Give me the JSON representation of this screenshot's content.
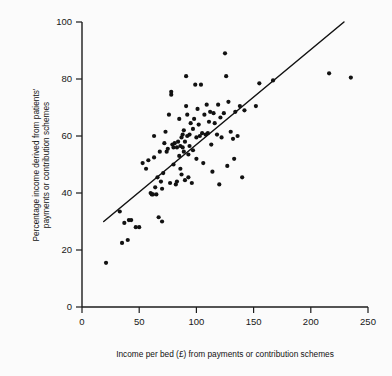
{
  "chart_data": {
    "type": "scatter",
    "title": "",
    "subtitle": "",
    "xlabel": "Income per bed (£) from payments or contribution schemes",
    "ylabel": "Percentage income derived from patients' payments or contribution schemes",
    "ylabel_lines": [
      "Percentage income derived from patients'",
      "payments or contribution schemes"
    ],
    "xlim": [
      0,
      250
    ],
    "ylim": [
      0,
      100
    ],
    "xticks": [
      0,
      50,
      100,
      150,
      200,
      250
    ],
    "yticks": [
      0,
      20,
      40,
      60,
      80,
      100
    ],
    "xtick_labels": [
      "0",
      "50",
      "100",
      "150",
      "200",
      "250"
    ],
    "ytick_labels": [
      "0",
      "20",
      "40",
      "60",
      "80",
      "100"
    ],
    "grid": false,
    "legend": false,
    "legend_position": "none",
    "marker": "filled-circle",
    "marker_color": "#121212",
    "marker_radius_px": 2.1,
    "background_color": "#fbfbfb",
    "axis_color": "#1c1c1c",
    "series": [
      {
        "name": "Hospitals",
        "type": "scatter",
        "points": [
          [
            21,
            15.5
          ],
          [
            33,
            33.5
          ],
          [
            35,
            22.5
          ],
          [
            37,
            29.5
          ],
          [
            40,
            23.5
          ],
          [
            41,
            30.5
          ],
          [
            43,
            30.5
          ],
          [
            47,
            28.0
          ],
          [
            50,
            28.0
          ],
          [
            53,
            50.5
          ],
          [
            56,
            48.5
          ],
          [
            58,
            51.5
          ],
          [
            60,
            40.0
          ],
          [
            61,
            39.5
          ],
          [
            62,
            39.5
          ],
          [
            63,
            60.0
          ],
          [
            63,
            52.5
          ],
          [
            64,
            42.0
          ],
          [
            65,
            39.5
          ],
          [
            66,
            45.5
          ],
          [
            67,
            31.5
          ],
          [
            68,
            54.5
          ],
          [
            69,
            44.0
          ],
          [
            70,
            30.0
          ],
          [
            70,
            41.5
          ],
          [
            71,
            47.0
          ],
          [
            72,
            57.5
          ],
          [
            73,
            61.5
          ],
          [
            74,
            54.5
          ],
          [
            75,
            55.5
          ],
          [
            76,
            67.5
          ],
          [
            77,
            43.5
          ],
          [
            78,
            74.5
          ],
          [
            78,
            75.5
          ],
          [
            79,
            57.0
          ],
          [
            80,
            56.0
          ],
          [
            80,
            50.0
          ],
          [
            81,
            57.5
          ],
          [
            82,
            43.0
          ],
          [
            83,
            56.0
          ],
          [
            83,
            44.0
          ],
          [
            84,
            58.0
          ],
          [
            85,
            53.0
          ],
          [
            85,
            66.0
          ],
          [
            86,
            56.5
          ],
          [
            86,
            48.5
          ],
          [
            87,
            59.5
          ],
          [
            87,
            46.5
          ],
          [
            88,
            60.5
          ],
          [
            88,
            56.0
          ],
          [
            89,
            62.0
          ],
          [
            89,
            54.5
          ],
          [
            90,
            58.0
          ],
          [
            90,
            44.5
          ],
          [
            91,
            81.0
          ],
          [
            91,
            70.5
          ],
          [
            92,
            67.5
          ],
          [
            92,
            60.0
          ],
          [
            93,
            53.5
          ],
          [
            93,
            45.5
          ],
          [
            94,
            60.5
          ],
          [
            94,
            56.5
          ],
          [
            95,
            64.5
          ],
          [
            96,
            43.5
          ],
          [
            97,
            55.0
          ],
          [
            97,
            62.5
          ],
          [
            98,
            66.0
          ],
          [
            99,
            78.0
          ],
          [
            100,
            52.0
          ],
          [
            100,
            59.5
          ],
          [
            101,
            69.5
          ],
          [
            102,
            64.0
          ],
          [
            103,
            60.0
          ],
          [
            104,
            78.0
          ],
          [
            105,
            61.0
          ],
          [
            106,
            50.5
          ],
          [
            107,
            67.5
          ],
          [
            108,
            60.5
          ],
          [
            109,
            71.0
          ],
          [
            110,
            61.0
          ],
          [
            111,
            65.0
          ],
          [
            112,
            68.5
          ],
          [
            113,
            57.0
          ],
          [
            114,
            47.5
          ],
          [
            115,
            68.0
          ],
          [
            116,
            64.5
          ],
          [
            118,
            60.5
          ],
          [
            119,
            71.0
          ],
          [
            120,
            43.0
          ],
          [
            121,
            66.5
          ],
          [
            122,
            59.5
          ],
          [
            124,
            68.0
          ],
          [
            125,
            89.0
          ],
          [
            126,
            81.0
          ],
          [
            127,
            49.5
          ],
          [
            128,
            72.0
          ],
          [
            130,
            61.5
          ],
          [
            132,
            59.0
          ],
          [
            133,
            52.0
          ],
          [
            134,
            68.5
          ],
          [
            136,
            60.0
          ],
          [
            138,
            70.5
          ],
          [
            140,
            45.5
          ],
          [
            142,
            69.0
          ],
          [
            152,
            70.5
          ],
          [
            155,
            78.5
          ],
          [
            167,
            79.5
          ],
          [
            216,
            82.0
          ],
          [
            235,
            80.5
          ]
        ]
      },
      {
        "name": "Regression line",
        "type": "line",
        "points": [
          [
            19,
            30.0
          ],
          [
            229,
            100.0
          ]
        ]
      }
    ]
  },
  "axes": {
    "x_title": "Income per bed (£) from payments or contribution schemes",
    "y_title_line1": "Percentage income derived from patients'",
    "y_title_line2": "payments or contribution schemes"
  }
}
